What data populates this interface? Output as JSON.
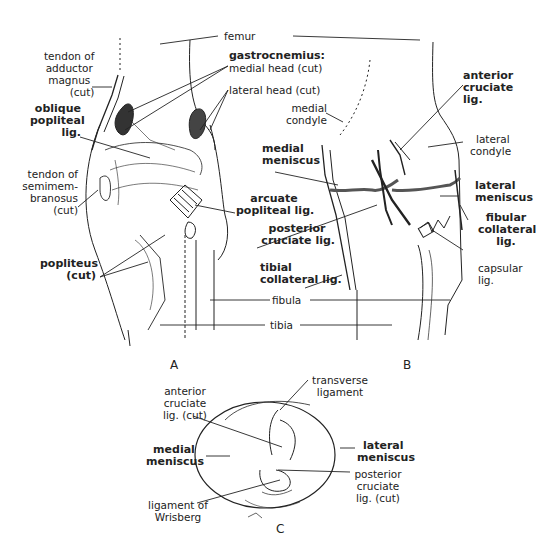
{
  "figure": {
    "panels": [
      {
        "id": "A",
        "label": "A"
      },
      {
        "id": "B",
        "label": "B"
      },
      {
        "id": "C",
        "label": "C"
      }
    ]
  },
  "labels": {
    "femur": "femur",
    "fibula": "fibula",
    "tibia": "tibia",
    "A": {
      "tendon_adductor": [
        "tendon of",
        "adductor",
        "magnus",
        "(cut)"
      ],
      "gastrocnemius_medial": [
        "gastrocnemius:",
        "medial head (cut)"
      ],
      "gastrocnemius_lateral": "lateral head (cut)",
      "oblique_popliteal": [
        "oblique",
        "popliteal",
        "lig."
      ],
      "tendon_semimembranosus": [
        "tendon of",
        "semimem-",
        "branosus",
        "(cut)"
      ],
      "arcuate_popliteal": [
        "arcuate",
        "popliteal lig."
      ],
      "popliteus": [
        "popliteus",
        "(cut)"
      ]
    },
    "B": {
      "medial_condyle": [
        "medial",
        "condyle"
      ],
      "medial_meniscus": [
        "medial",
        "meniscus"
      ],
      "posterior_cruciate": [
        "posterior",
        "cruciate lig."
      ],
      "tibial_collateral": [
        "tibial",
        "collateral lig."
      ],
      "anterior_cruciate": [
        "anterior",
        "cruciate",
        "lig."
      ],
      "lateral_condyle": [
        "lateral",
        "condyle"
      ],
      "lateral_meniscus": [
        "lateral",
        "meniscus"
      ],
      "fibular_collateral": [
        "fibular",
        "collateral",
        "lig."
      ],
      "capsular": [
        "capsular",
        "lig."
      ]
    },
    "C": {
      "anterior_cruciate_cut": [
        "anterior",
        "cruciate",
        "lig. (cut)"
      ],
      "transverse_ligament": [
        "transverse",
        "ligament"
      ],
      "medial_meniscus": [
        "medial",
        "meniscus"
      ],
      "lateral_meniscus": [
        "lateral",
        "meniscus"
      ],
      "posterior_cruciate_cut": [
        "posterior",
        "cruciate",
        "lig. (cut)"
      ],
      "ligament_wrisberg": [
        "ligament of",
        "Wrisberg"
      ]
    }
  }
}
